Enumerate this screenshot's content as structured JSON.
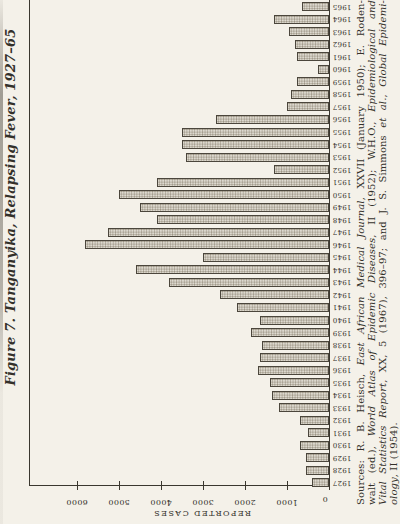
{
  "page_background": "#f4f1e9",
  "ink_color": "#33302a",
  "bar_fill": "#ddd9cf",
  "bar_dot": "#958d7d",
  "bar_border": "#4b463c",
  "title": "Figure 7. Tanganyika, Relapsing Fever, 1927–65",
  "y_axis": {
    "label": "REPORTED CASES",
    "tick_labels": [
      "0",
      "1000",
      "2000",
      "3000",
      "4000",
      "5000",
      "6000"
    ]
  },
  "chart_data": {
    "type": "bar",
    "title": "Figure 7. Tanganyika, Relapsing Fever, 1927–65",
    "xlabel": "",
    "ylabel": "REPORTED CASES",
    "ylim": [
      0,
      7000
    ],
    "yticks": [
      0,
      1000,
      2000,
      3000,
      4000,
      5000,
      6000
    ],
    "grid": false,
    "layout_note": "vertical bars; whole page printed rotated 90 degrees counterclockwise",
    "categories": [
      1927,
      1928,
      1929,
      1930,
      1931,
      1932,
      1933,
      1934,
      1935,
      1936,
      1937,
      1938,
      1939,
      1940,
      1941,
      1942,
      1943,
      1944,
      1945,
      1946,
      1947,
      1948,
      1949,
      1950,
      1951,
      1952,
      1953,
      1954,
      1955,
      1956,
      1957,
      1958,
      1959,
      1960,
      1961,
      1962,
      1963,
      1964,
      1965
    ],
    "values": [
      400,
      550,
      550,
      700,
      500,
      700,
      1200,
      1350,
      1400,
      1700,
      1650,
      1600,
      1850,
      1650,
      2200,
      2600,
      3800,
      4600,
      3000,
      5800,
      5250,
      4100,
      4500,
      5000,
      4100,
      1300,
      3400,
      3500,
      3500,
      2700,
      1000,
      900,
      750,
      250,
      750,
      800,
      950,
      1300,
      650
    ]
  },
  "sources": {
    "lines": [
      {
        "last": false,
        "segments": [
          {
            "text": "Sources: R. B. Heisch, ",
            "italic": false
          },
          {
            "text": "East African Medical Journal",
            "italic": true
          },
          {
            "text": ", XXVII (January 1950); E. Roden-",
            "italic": false
          }
        ]
      },
      {
        "last": false,
        "segments": [
          {
            "text": "walt (ed.), ",
            "italic": false
          },
          {
            "text": "World Atlas of Epidemic Diseases",
            "italic": true
          },
          {
            "text": ", II (1952); W.H.O., ",
            "italic": false
          },
          {
            "text": "Epidemiological and",
            "italic": true
          }
        ]
      },
      {
        "last": false,
        "segments": [
          {
            "text": "Vital Statistics Report",
            "italic": true
          },
          {
            "text": ", XX, 5 (1967), 396–97; and J. S. Simmons ",
            "italic": false
          },
          {
            "text": "et al.",
            "italic": true
          },
          {
            "text": ", ",
            "italic": false
          },
          {
            "text": "Global Epidemi-",
            "italic": true
          }
        ]
      },
      {
        "last": true,
        "segments": [
          {
            "text": "ology",
            "italic": true
          },
          {
            "text": ", II (1954).",
            "italic": false
          }
        ]
      }
    ]
  }
}
